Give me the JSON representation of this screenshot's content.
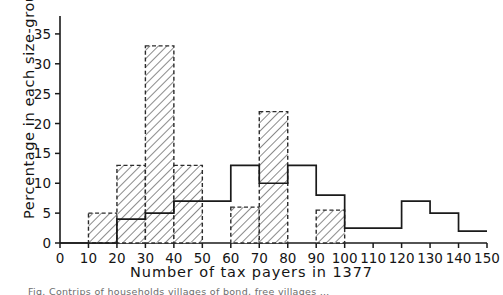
{
  "chart_data": {
    "type": "bar",
    "title": "",
    "xlabel": "Number of tax payers in 1377",
    "ylabel": "Percentage in each size-group",
    "xlim": [
      0,
      150
    ],
    "ylim": [
      0,
      38
    ],
    "xticks": [
      0,
      10,
      20,
      30,
      40,
      50,
      60,
      70,
      80,
      90,
      100,
      110,
      120,
      130,
      140,
      150
    ],
    "yticks": [
      0,
      5,
      10,
      15,
      20,
      25,
      30,
      35
    ],
    "grid": false,
    "legend": "none",
    "bin_edges": [
      0,
      10,
      20,
      30,
      40,
      50,
      60,
      70,
      80,
      90,
      100,
      110,
      120,
      130,
      140,
      150
    ],
    "series": [
      {
        "name": "hatched-distribution",
        "style": "hatched-dashed-outline",
        "values": [
          0,
          5,
          13,
          33,
          13,
          0,
          6,
          22,
          0,
          5.5,
          0,
          0,
          0,
          0,
          0
        ]
      },
      {
        "name": "solid-outline-distribution",
        "style": "solid-outline",
        "values": [
          0,
          0,
          4,
          5,
          7,
          7,
          13,
          10,
          13,
          8,
          2.5,
          2.5,
          7,
          5,
          2
        ]
      }
    ]
  },
  "caption": {
    "text": "Fig. Contrips of households villages of bond, free villages …"
  }
}
